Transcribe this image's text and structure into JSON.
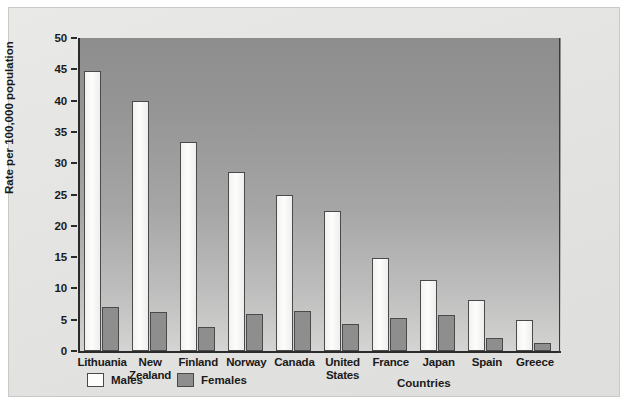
{
  "chart_data": {
    "type": "bar",
    "title": "",
    "xlabel": "Countries",
    "ylabel": "Rate per 100,000 population",
    "ylim": [
      0,
      50
    ],
    "yticks": [
      0,
      5,
      10,
      15,
      20,
      25,
      30,
      35,
      40,
      45,
      50
    ],
    "grid": false,
    "legend_position": "bottom-left",
    "categories": [
      "Lithuania",
      "New Zealand",
      "Finland",
      "Norway",
      "Canada",
      "United States",
      "France",
      "Japan",
      "Spain",
      "Greece"
    ],
    "series": [
      {
        "name": "Males",
        "color": "#fdfdfc",
        "values": [
          44.8,
          40.0,
          33.4,
          28.6,
          24.9,
          22.3,
          14.9,
          11.4,
          8.2,
          5.0
        ]
      },
      {
        "name": "Females",
        "color": "#8e8e8e",
        "values": [
          7.0,
          6.2,
          3.8,
          5.9,
          6.4,
          4.3,
          5.2,
          5.7,
          2.1,
          1.2
        ]
      }
    ]
  },
  "legend": {
    "entries": [
      {
        "label": "Males",
        "swatch": "male"
      },
      {
        "label": "Females",
        "swatch": "female"
      }
    ]
  },
  "colors": {
    "plot_background_top": "#8d8d8d",
    "plot_background_bottom": "#d4d4d2",
    "figure_background": "#e7e7e5",
    "axis": "#2b2b2b",
    "bar_outline": "#4a4a4a"
  }
}
